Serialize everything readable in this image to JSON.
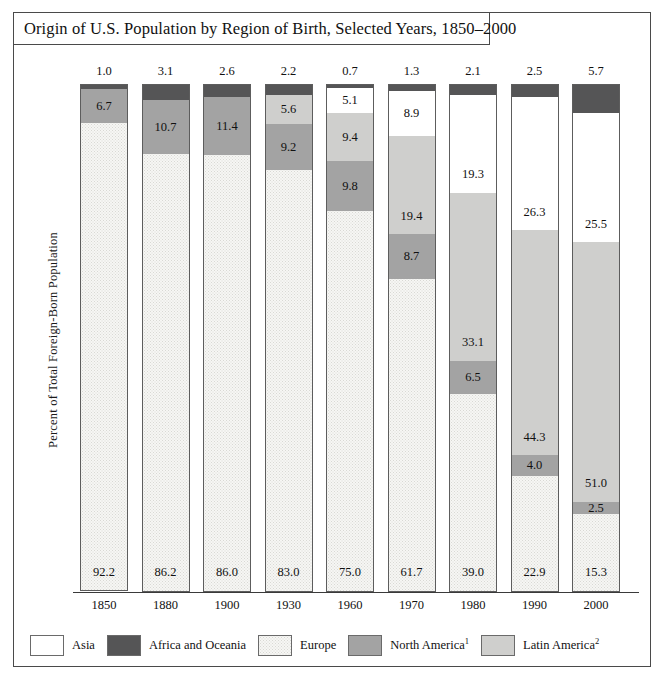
{
  "figure": {
    "title": "Origin of U.S. Population by Region of Birth, Selected Years, 1850–2000",
    "ylabel": "Percent of Total Foreign-Born Population"
  },
  "legend": {
    "items": [
      {
        "key": "asia",
        "label": "Asia",
        "sup": "",
        "color": "#ffffff"
      },
      {
        "key": "africa",
        "label": "Africa and Oceania",
        "sup": "",
        "color": "#555556"
      },
      {
        "key": "europe",
        "label": "Europe",
        "sup": "",
        "color": "#f6f6f4"
      },
      {
        "key": "north",
        "label": "North America",
        "sup": "1",
        "color": "#a3a3a3"
      },
      {
        "key": "latin",
        "label": "Latin America",
        "sup": "2",
        "color": "#cfcfcd"
      }
    ]
  },
  "chart_data": {
    "type": "bar",
    "subtype": "stacked-100",
    "title": "Origin of U.S. Population by Region of Birth, Selected Years, 1850–2000",
    "xlabel": "",
    "ylabel": "Percent of Total Foreign-Born Population",
    "ylim": [
      0,
      100
    ],
    "grid": false,
    "legend_position": "bottom",
    "categories": [
      "1850",
      "1880",
      "1900",
      "1930",
      "1960",
      "1970",
      "1980",
      "1990",
      "2000"
    ],
    "series": [
      {
        "name": "Africa and Oceania",
        "key": "africa",
        "values": [
          1.0,
          3.1,
          2.6,
          2.2,
          0.7,
          1.3,
          2.1,
          2.5,
          5.7
        ]
      },
      {
        "name": "Asia",
        "key": "asia",
        "values": [
          0.0,
          0.0,
          0.0,
          0.0,
          5.1,
          8.9,
          19.3,
          26.3,
          25.5
        ]
      },
      {
        "name": "Latin America",
        "key": "latin",
        "values": [
          0.0,
          0.0,
          0.0,
          5.6,
          9.4,
          19.4,
          33.1,
          44.3,
          51.0
        ]
      },
      {
        "name": "North America",
        "key": "north",
        "values": [
          6.7,
          10.7,
          11.4,
          9.2,
          9.8,
          8.7,
          6.5,
          4.0,
          2.5
        ]
      },
      {
        "name": "Europe",
        "key": "europe",
        "values": [
          92.2,
          86.2,
          86.0,
          83.0,
          75.0,
          61.7,
          39.0,
          22.9,
          15.3
        ]
      }
    ],
    "top_labels": [
      "1.0",
      "3.1",
      "2.6",
      "2.2",
      "0.7",
      "1.3",
      "2.1",
      "2.5",
      "5.7"
    ],
    "bars": [
      {
        "year": "1850",
        "top_label": "1.0",
        "segments": [
          {
            "key": "africa",
            "value": 1.0,
            "label": ""
          },
          {
            "key": "north",
            "value": 6.7,
            "label": "6.7"
          },
          {
            "key": "europe",
            "value": 92.2,
            "label": "92.2"
          }
        ]
      },
      {
        "year": "1880",
        "top_label": "3.1",
        "segments": [
          {
            "key": "africa",
            "value": 3.1,
            "label": ""
          },
          {
            "key": "north",
            "value": 10.7,
            "label": "10.7"
          },
          {
            "key": "europe",
            "value": 86.2,
            "label": "86.2"
          }
        ]
      },
      {
        "year": "1900",
        "top_label": "2.6",
        "segments": [
          {
            "key": "africa",
            "value": 2.6,
            "label": ""
          },
          {
            "key": "north",
            "value": 11.4,
            "label": "11.4"
          },
          {
            "key": "europe",
            "value": 86.0,
            "label": "86.0"
          }
        ]
      },
      {
        "year": "1930",
        "top_label": "2.2",
        "segments": [
          {
            "key": "africa",
            "value": 2.2,
            "label": ""
          },
          {
            "key": "latin",
            "value": 5.6,
            "label": "5.6"
          },
          {
            "key": "north",
            "value": 9.2,
            "label": "9.2"
          },
          {
            "key": "europe",
            "value": 83.0,
            "label": "83.0"
          }
        ]
      },
      {
        "year": "1960",
        "top_label": "0.7",
        "segments": [
          {
            "key": "africa",
            "value": 0.7,
            "label": ""
          },
          {
            "key": "asia",
            "value": 5.1,
            "label": "5.1"
          },
          {
            "key": "latin",
            "value": 9.4,
            "label": "9.4"
          },
          {
            "key": "north",
            "value": 9.8,
            "label": "9.8"
          },
          {
            "key": "europe",
            "value": 75.0,
            "label": "75.0"
          }
        ]
      },
      {
        "year": "1970",
        "top_label": "1.3",
        "segments": [
          {
            "key": "africa",
            "value": 1.3,
            "label": ""
          },
          {
            "key": "asia",
            "value": 8.9,
            "label": "8.9"
          },
          {
            "key": "latin",
            "value": 19.4,
            "label": "19.4"
          },
          {
            "key": "north",
            "value": 8.7,
            "label": "8.7"
          },
          {
            "key": "europe",
            "value": 61.7,
            "label": "61.7"
          }
        ]
      },
      {
        "year": "1980",
        "top_label": "2.1",
        "segments": [
          {
            "key": "africa",
            "value": 2.1,
            "label": ""
          },
          {
            "key": "asia",
            "value": 19.3,
            "label": "19.3"
          },
          {
            "key": "latin",
            "value": 33.1,
            "label": "33.1"
          },
          {
            "key": "north",
            "value": 6.5,
            "label": "6.5"
          },
          {
            "key": "europe",
            "value": 39.0,
            "label": "39.0"
          }
        ]
      },
      {
        "year": "1990",
        "top_label": "2.5",
        "segments": [
          {
            "key": "africa",
            "value": 2.5,
            "label": ""
          },
          {
            "key": "asia",
            "value": 26.3,
            "label": "26.3"
          },
          {
            "key": "latin",
            "value": 44.3,
            "label": "44.3"
          },
          {
            "key": "north",
            "value": 4.0,
            "label": "4.0"
          },
          {
            "key": "europe",
            "value": 22.9,
            "label": "22.9"
          }
        ]
      },
      {
        "year": "2000",
        "top_label": "5.7",
        "segments": [
          {
            "key": "africa",
            "value": 5.7,
            "label": ""
          },
          {
            "key": "asia",
            "value": 25.5,
            "label": "25.5"
          },
          {
            "key": "latin",
            "value": 51.0,
            "label": "51.0"
          },
          {
            "key": "north",
            "value": 2.5,
            "label": "2.5"
          },
          {
            "key": "europe",
            "value": 15.3,
            "label": "15.3"
          }
        ]
      }
    ]
  }
}
